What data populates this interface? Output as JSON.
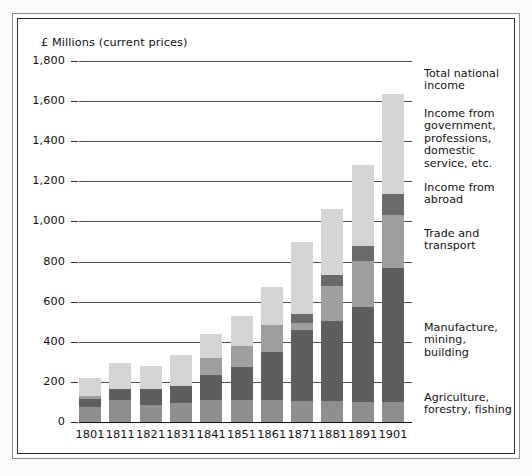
{
  "chart_data": {
    "type": "bar",
    "subtype": "stacked",
    "title": "",
    "axis_title": "£ Millions (current prices)",
    "xlabel": "",
    "ylabel": "£ Millions (current prices)",
    "ylim": [
      0,
      1800
    ],
    "yticks": [
      0,
      200,
      400,
      600,
      800,
      1000,
      1200,
      1400,
      1600,
      1800
    ],
    "ytick_labels": [
      "0",
      "200",
      "400",
      "600",
      "800",
      "1,000",
      "1,200",
      "1,400",
      "1,600",
      "1,800"
    ],
    "grid": true,
    "legend_position": "right",
    "categories": [
      "1801",
      "1811",
      "1821",
      "1831",
      "1841",
      "1851",
      "1861",
      "1871",
      "1881",
      "1891",
      "1901"
    ],
    "series": [
      {
        "name": "Agriculture, forestry, fishing",
        "color": "#8f8f8f",
        "values": [
          75,
          110,
          85,
          95,
          110,
          110,
          110,
          105,
          105,
          100,
          100
        ]
      },
      {
        "name": "Manufacture, mining, building",
        "color": "#5e5e5e",
        "values": [
          40,
          55,
          80,
          85,
          125,
          165,
          240,
          355,
          400,
          475,
          670
        ]
      },
      {
        "name": "Trade and transport",
        "color": "#9e9e9e",
        "values": [
          15,
          0,
          0,
          0,
          85,
          105,
          135,
          35,
          175,
          230,
          260
        ]
      },
      {
        "name": "Income from abroad",
        "color": "#6a6a6a",
        "values": [
          0,
          0,
          0,
          0,
          0,
          0,
          0,
          45,
          55,
          75,
          105
        ]
      },
      {
        "name": "Income from government, professions, domestic service, etc.",
        "color": "#d4d4d2",
        "values": [
          90,
          130,
          115,
          155,
          120,
          150,
          190,
          360,
          325,
          400,
          500
        ]
      }
    ],
    "totals": [
      220,
      295,
      280,
      335,
      440,
      530,
      675,
      900,
      1060,
      1280,
      1635
    ],
    "legend_entries": [
      {
        "key": "total-national-income",
        "label": "Total national\nincome"
      },
      {
        "key": "income-from-government",
        "label": "Income from\ngovernment,\nprofessions,\ndomestic\nservice, etc."
      },
      {
        "key": "income-from-abroad",
        "label": "Income from\nabroad"
      },
      {
        "key": "trade-and-transport",
        "label": "Trade and\ntransport"
      },
      {
        "key": "manufacture-mining-building",
        "label": "Manufacture,\nmining,\nbuilding"
      },
      {
        "key": "agriculture-forestry-fishing",
        "label": "Agriculture,\nforestry, fishing"
      }
    ]
  },
  "legend": {
    "total_national_income": "Total national income",
    "income_from_government": "Income from government, professions, domestic service, etc.",
    "income_from_abroad": "Income from abroad",
    "trade_and_transport": "Trade and transport",
    "manufacture_mining_building": "Manufacture, mining, building",
    "agriculture_forestry_fishing": "Agriculture, forestry, fishing"
  },
  "colors": {
    "agriculture": "#8f8f8f",
    "manufacture": "#5e5e5e",
    "trade": "#9e9e9e",
    "abroad": "#6a6a6a",
    "government": "#d4d4d2",
    "gridline": "#4a4a4a",
    "axis": "#111111",
    "frame": "#2b2b2b",
    "page_background": "#ffffff"
  }
}
